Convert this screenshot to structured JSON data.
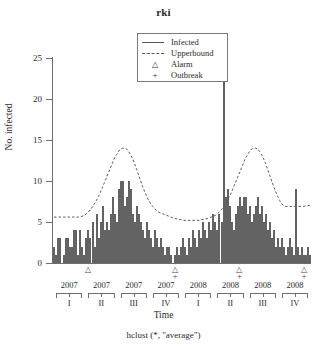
{
  "chart_data": {
    "type": "bar",
    "title": "rki",
    "xlabel": "Time",
    "ylabel": "No. infected",
    "subtitle": "hclust (*, \"average\")",
    "ylim": [
      0,
      28
    ],
    "yticks": [
      0,
      5,
      10,
      15,
      20,
      25
    ],
    "grid": false,
    "legend_position": "top-center",
    "legend": [
      {
        "label": "Infected",
        "key": "solid-line"
      },
      {
        "label": "Upperbound",
        "key": "dashed-line"
      },
      {
        "label": "Alarm",
        "key": "triangle"
      },
      {
        "label": "Outbreak",
        "key": "plus"
      }
    ],
    "x_axis": {
      "years": [
        "2007",
        "2007",
        "2007",
        "2007",
        "2008",
        "2008",
        "2008",
        "2008"
      ],
      "quarters": [
        "I",
        "II",
        "III",
        "IV",
        "I",
        "II",
        "III",
        "IV"
      ]
    },
    "series": [
      {
        "name": "Infected",
        "type": "bar",
        "values": [
          2,
          1,
          3,
          3,
          0,
          1,
          3,
          3,
          2,
          2,
          4,
          4,
          1,
          4,
          2,
          1,
          3,
          4,
          3,
          5,
          2,
          6,
          3,
          5,
          7,
          4,
          5,
          4,
          6,
          8,
          6,
          5,
          9,
          10,
          10,
          7,
          8,
          10,
          9,
          6,
          5,
          7,
          6,
          5,
          4,
          3,
          5,
          4,
          3,
          2,
          4,
          3,
          2,
          3,
          2,
          1,
          2,
          2,
          1,
          0,
          1,
          2,
          1,
          2,
          3,
          2,
          1,
          3,
          2,
          4,
          3,
          2,
          4,
          3,
          5,
          4,
          3,
          5,
          4,
          6,
          5,
          4,
          6,
          5,
          28,
          8,
          9,
          7,
          5,
          4,
          6,
          7,
          8,
          7,
          8,
          8,
          6,
          7,
          5,
          6,
          7,
          8,
          6,
          7,
          5,
          6,
          4,
          5,
          3,
          4,
          2,
          3,
          2,
          3,
          2,
          1,
          2,
          3,
          2,
          1,
          9,
          2,
          1,
          2,
          1,
          1,
          2,
          1
        ]
      },
      {
        "name": "Upperbound",
        "type": "line",
        "style": "dashed",
        "values": [
          5.6,
          5.6,
          5.6,
          5.6,
          5.6,
          5.6,
          5.6,
          5.6,
          5.6,
          5.6,
          5.6,
          5.6,
          5.6,
          5.6,
          5.7,
          5.8,
          6.0,
          6.2,
          6.5,
          6.8,
          7.2,
          7.6,
          8.1,
          8.6,
          9.2,
          9.8,
          10.4,
          11.0,
          11.6,
          12.2,
          12.8,
          13.2,
          13.6,
          13.9,
          14.0,
          14.0,
          13.9,
          13.6,
          13.2,
          12.7,
          12.1,
          11.4,
          10.7,
          10.0,
          9.3,
          8.7,
          8.1,
          7.6,
          7.2,
          6.9,
          6.6,
          6.4,
          6.2,
          6.1,
          6.0,
          5.9,
          5.8,
          5.7,
          5.6,
          5.5,
          5.4,
          5.4,
          5.3,
          5.3,
          5.2,
          5.2,
          5.2,
          5.2,
          5.2,
          5.2,
          5.2,
          5.2,
          5.2,
          5.3,
          5.3,
          5.4,
          5.4,
          5.5,
          5.6,
          5.7,
          5.8,
          6.0,
          6.2,
          6.5,
          6.8,
          7.2,
          7.6,
          8.1,
          8.6,
          9.2,
          9.8,
          10.4,
          11.0,
          11.6,
          12.2,
          12.8,
          13.2,
          13.6,
          13.9,
          14.0,
          14.0,
          13.9,
          13.6,
          13.2,
          12.7,
          12.1,
          11.4,
          10.7,
          10.0,
          9.3,
          8.7,
          8.1,
          7.6,
          7.2,
          7.0,
          6.9,
          6.9,
          6.9,
          6.9,
          6.9,
          6.9,
          6.9,
          6.9,
          6.9,
          6.9,
          7.0,
          7.0,
          7.0,
          7.0
        ]
      }
    ],
    "alarms": [
      {
        "index": 17,
        "label": "Alarm"
      },
      {
        "index": 60,
        "label": "Alarm"
      },
      {
        "index": 92,
        "label": "Alarm"
      },
      {
        "index": 124,
        "label": "Alarm"
      }
    ],
    "outbreaks": [
      {
        "index": 60,
        "label": "Outbreak"
      },
      {
        "index": 92,
        "label": "Outbreak"
      },
      {
        "index": 124,
        "label": "Outbreak"
      }
    ]
  }
}
